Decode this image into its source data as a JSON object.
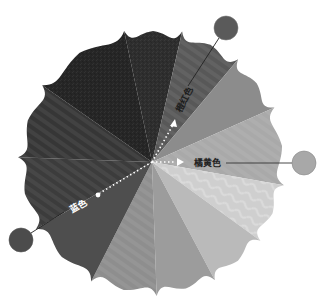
{
  "diagram": {
    "type": "color-wheel",
    "center": [
      152,
      162
    ],
    "radius": 132,
    "segments": [
      {
        "start": -12,
        "end": 13,
        "color": "#2e2e2e",
        "texture": "noise"
      },
      {
        "start": 13,
        "end": 40,
        "color": "#585858",
        "texture": "stripe",
        "label": "橙红色"
      },
      {
        "start": 40,
        "end": 66,
        "color": "#8c8c8c",
        "texture": "none"
      },
      {
        "start": 66,
        "end": 100,
        "color": "#a9a9a9",
        "texture": "stripe",
        "label": "橘黄色"
      },
      {
        "start": 100,
        "end": 126,
        "color": "#cfcfcf",
        "texture": "wave"
      },
      {
        "start": 126,
        "end": 152,
        "color": "#bababa",
        "texture": "none"
      },
      {
        "start": 152,
        "end": 178,
        "color": "#9c9c9c",
        "texture": "none"
      },
      {
        "start": 178,
        "end": 207,
        "color": "#8e8e8e",
        "texture": "stripe"
      },
      {
        "start": 207,
        "end": 240,
        "color": "#4e4e4e",
        "texture": "none",
        "label": "蓝色"
      },
      {
        "start": 240,
        "end": 272,
        "color": "#3c3c3c",
        "texture": "stripe"
      },
      {
        "start": 272,
        "end": 305,
        "color": "#363636",
        "texture": "stripe"
      },
      {
        "start": 305,
        "end": 348,
        "color": "#262626",
        "texture": "noise"
      }
    ]
  },
  "labels": {
    "orange_red": "橙红色",
    "orange_yellow": "橘黄色",
    "blue": "蓝色"
  },
  "swatches": {
    "orange_red": {
      "cx": 226,
      "cy": 28,
      "r": 12,
      "color": "#5a5a5a"
    },
    "orange_yellow": {
      "cx": 304,
      "cy": 163,
      "r": 12,
      "color": "#a8a8a8"
    },
    "blue": {
      "cx": 21,
      "cy": 240,
      "r": 12,
      "color": "#4c4c4c"
    }
  }
}
